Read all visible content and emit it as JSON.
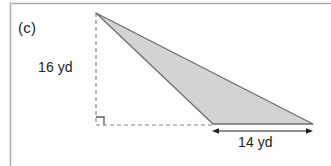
{
  "figure": {
    "part_label": "(c)",
    "shape": "triangle",
    "height_label": "16 yd",
    "base_label": "14 yd",
    "height_value": 16,
    "base_value": 14,
    "units": "yd",
    "right_angle_marker": true,
    "colors": {
      "fill": "#d2d3d5",
      "stroke": "#6e6e72",
      "dashed": "#8a8a8e",
      "text": "#231f20",
      "border": "#a9a9ad",
      "background": "#fdfdfd"
    },
    "geometry": {
      "apex": [
        96,
        13
      ],
      "bottom_left_vertex": [
        213,
        124
      ],
      "right_vertex": [
        313,
        124
      ],
      "foot_of_height": [
        96,
        125
      ],
      "dimension_line_y": 131
    }
  }
}
